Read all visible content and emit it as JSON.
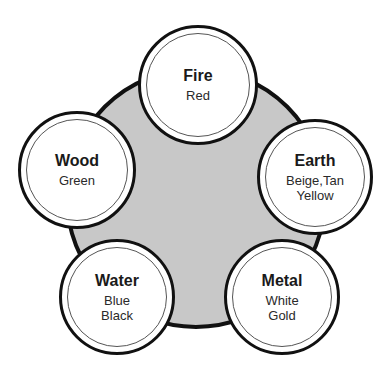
{
  "diagram": {
    "type": "five-elements-color-wheel",
    "center": {
      "fill": "#c8c8c8",
      "stroke": "#111111",
      "cx": 196,
      "cy": 198,
      "r": 131
    },
    "nodes": [
      {
        "id": "fire",
        "name": "Fire",
        "colors": [
          "Red"
        ],
        "cx": 198,
        "cy": 85,
        "r": 60
      },
      {
        "id": "earth",
        "name": "Earth",
        "colors": [
          "Beige,Tan",
          "Yellow"
        ],
        "cx": 315,
        "cy": 177,
        "r": 58
      },
      {
        "id": "metal",
        "name": "Metal",
        "colors": [
          "White",
          "Gold"
        ],
        "cx": 282,
        "cy": 297,
        "r": 58
      },
      {
        "id": "water",
        "name": "Water",
        "colors": [
          "Blue",
          "Black"
        ],
        "cx": 117,
        "cy": 297,
        "r": 58
      },
      {
        "id": "wood",
        "name": "Wood",
        "colors": [
          "Green"
        ],
        "cx": 77,
        "cy": 170,
        "r": 59
      }
    ]
  }
}
